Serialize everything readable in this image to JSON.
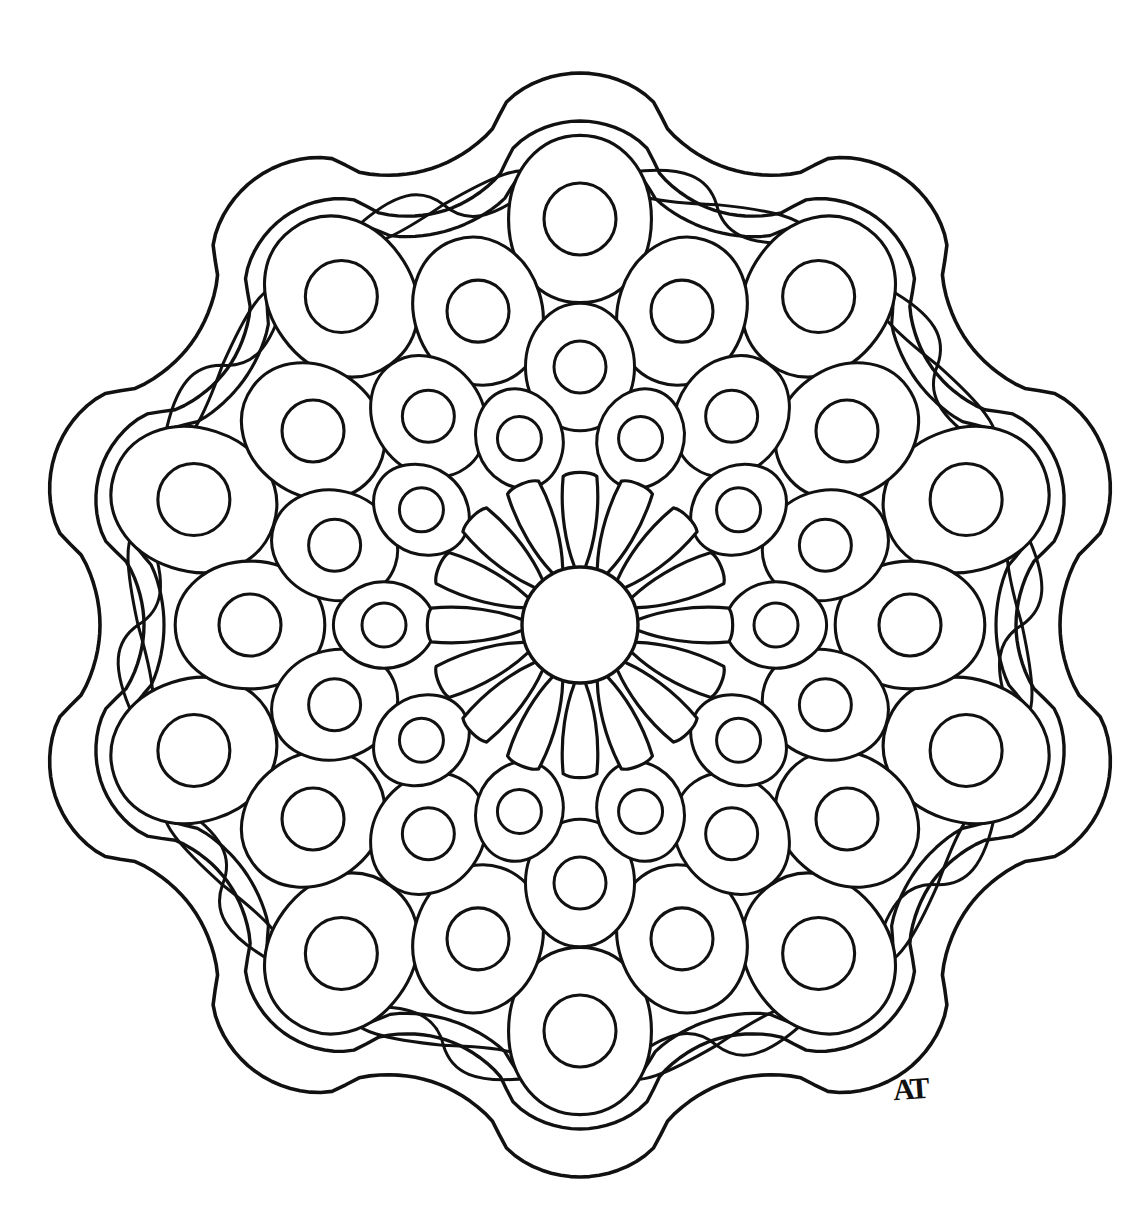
{
  "artwork": {
    "title": "Mandala Coloring Page",
    "kind": "line-art-mandala",
    "signature": "AT",
    "signature_position": {
      "x": 893,
      "y": 1072
    },
    "background_color": "#ffffff",
    "stroke_color": "#111111",
    "fill_color": "none"
  },
  "canvas": {
    "width": 1147,
    "height": 1225,
    "center_x": 580,
    "center_y": 625
  },
  "structure": {
    "symmetry": 10,
    "description": "Concentric mandala: hub circle, 16 radiating petals, several rings of rounded cells each containing a circle, enclosed by a double-line scalloped border decorated with paired teardrop paisleys."
  },
  "elements": {
    "hub": {
      "name": "center-circle",
      "radius": 58,
      "stroke_width": 3.4
    },
    "petal_ring": {
      "name": "petal-ring",
      "count": 16,
      "inner_radius": 60,
      "outer_radius": 152,
      "half_width_deg": 10.4,
      "tip_round": 0.62,
      "stroke_width": 3.2
    },
    "cell_rings": [
      {
        "name": "ring-1-small-cells",
        "count": 10,
        "center_radius": 196,
        "cell_radius": 46,
        "dot_radius": 22,
        "angle_offset_deg": 18,
        "squircle": 0.72,
        "stroke_width": 3.0
      },
      {
        "name": "ring-2-cells",
        "count": 10,
        "center_radius": 258,
        "cell_radius": 58,
        "dot_radius": 26,
        "angle_offset_deg": 0,
        "squircle": 0.74,
        "stroke_width": 3.0
      },
      {
        "name": "ring-3-cells",
        "count": 10,
        "center_radius": 330,
        "cell_radius": 68,
        "dot_radius": 31,
        "angle_offset_deg": 18,
        "squircle": 0.76,
        "stroke_width": 3.1
      },
      {
        "name": "ring-4-cells",
        "count": 10,
        "center_radius": 406,
        "cell_radius": 76,
        "dot_radius": 36,
        "angle_offset_deg": 0,
        "squircle": 0.78,
        "stroke_width": 3.1
      },
      {
        "name": "ring-5-cells",
        "count": 10,
        "center_radius": 396,
        "cell_radius": 74,
        "dot_radius": 35,
        "angle_offset_deg": 18,
        "squircle": 0.78,
        "stroke_width": 3.1,
        "enabled": false
      }
    ],
    "inner_scallop": {
      "name": "inner-scalloped-ring",
      "lobes": 10,
      "base_radius": 442,
      "amplitude": 26,
      "stroke_width": 3.2
    },
    "border_scallops": [
      {
        "name": "border-scallop-inner",
        "lobes": 10,
        "base_radius": 470,
        "amplitude": 34,
        "stroke_width": 3.4
      },
      {
        "name": "border-scallop-outer",
        "lobes": 10,
        "base_radius": 516,
        "amplitude": 36,
        "stroke_width": 3.6
      }
    ],
    "paisleys": {
      "name": "teardrop-paisley-pair",
      "pairs": 10,
      "anchor_radius": 442,
      "length": 96,
      "bulb_width": 34,
      "spread_deg": 30,
      "stroke_width": 3.0
    }
  },
  "palette": {
    "ink": "#111111",
    "paper": "#ffffff"
  }
}
